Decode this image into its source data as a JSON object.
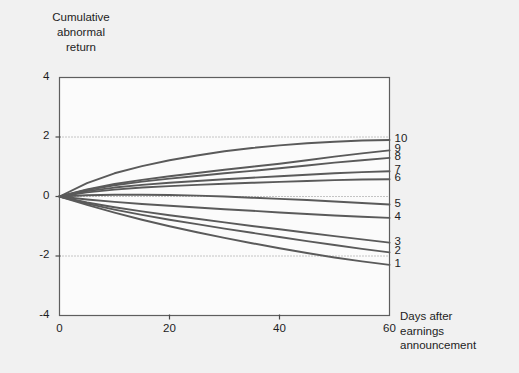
{
  "chart_data": {
    "type": "line",
    "title": "",
    "ylabel": "Cumulative\nabnormal\nreturn",
    "xlabel": "Days after\nearnings\nannouncement",
    "xlim": [
      0,
      60
    ],
    "ylim": [
      -4,
      4
    ],
    "xticks": [
      0,
      20,
      40,
      60
    ],
    "xtick_labels": [
      "0",
      "20",
      "40",
      "60"
    ],
    "yticks": [
      4,
      2,
      0,
      -2,
      -4
    ],
    "ytick_labels": [
      "4",
      "2",
      "0",
      "-2",
      "-4"
    ],
    "gridlines": [
      2,
      0,
      -2
    ],
    "grid": "horizontal-dotted",
    "legend_position": "right-endpoint-labels",
    "line_color": "#5a5a5a",
    "x": [
      0,
      5,
      10,
      15,
      20,
      25,
      30,
      35,
      40,
      45,
      50,
      55,
      60
    ],
    "series": [
      {
        "name": "10",
        "label": "10",
        "values": [
          0.0,
          0.45,
          0.78,
          1.02,
          1.22,
          1.38,
          1.52,
          1.63,
          1.72,
          1.79,
          1.84,
          1.88,
          1.9
        ]
      },
      {
        "name": "9",
        "label": "9",
        "values": [
          0.0,
          0.24,
          0.42,
          0.56,
          0.68,
          0.79,
          0.9,
          1.0,
          1.1,
          1.22,
          1.34,
          1.45,
          1.55
        ]
      },
      {
        "name": "8",
        "label": "8",
        "values": [
          0.0,
          0.22,
          0.38,
          0.5,
          0.6,
          0.69,
          0.78,
          0.86,
          0.95,
          1.04,
          1.14,
          1.22,
          1.3
        ]
      },
      {
        "name": "7",
        "label": "7",
        "values": [
          0.0,
          0.18,
          0.3,
          0.39,
          0.46,
          0.52,
          0.58,
          0.63,
          0.68,
          0.73,
          0.78,
          0.82,
          0.85
        ]
      },
      {
        "name": "6",
        "label": "6",
        "values": [
          0.0,
          0.14,
          0.23,
          0.3,
          0.35,
          0.39,
          0.43,
          0.46,
          0.49,
          0.52,
          0.55,
          0.57,
          0.58
        ]
      },
      {
        "name": "5",
        "label": "5",
        "values": [
          0.0,
          0.04,
          0.06,
          0.06,
          0.05,
          0.03,
          0.0,
          -0.04,
          -0.08,
          -0.12,
          -0.17,
          -0.22,
          -0.27
        ]
      },
      {
        "name": "4",
        "label": "4",
        "values": [
          0.0,
          -0.1,
          -0.18,
          -0.25,
          -0.31,
          -0.37,
          -0.43,
          -0.48,
          -0.54,
          -0.59,
          -0.64,
          -0.68,
          -0.72
        ]
      },
      {
        "name": "3",
        "label": "3",
        "values": [
          0.0,
          -0.2,
          -0.36,
          -0.5,
          -0.63,
          -0.75,
          -0.87,
          -0.99,
          -1.1,
          -1.22,
          -1.33,
          -1.44,
          -1.55
        ]
      },
      {
        "name": "2",
        "label": "2",
        "values": [
          0.0,
          -0.24,
          -0.44,
          -0.62,
          -0.78,
          -0.93,
          -1.08,
          -1.22,
          -1.36,
          -1.5,
          -1.63,
          -1.76,
          -1.88
        ]
      },
      {
        "name": "1",
        "label": "1",
        "values": [
          0.0,
          -0.28,
          -0.54,
          -0.78,
          -1.0,
          -1.2,
          -1.39,
          -1.57,
          -1.74,
          -1.9,
          -2.05,
          -2.18,
          -2.3
        ]
      }
    ]
  }
}
